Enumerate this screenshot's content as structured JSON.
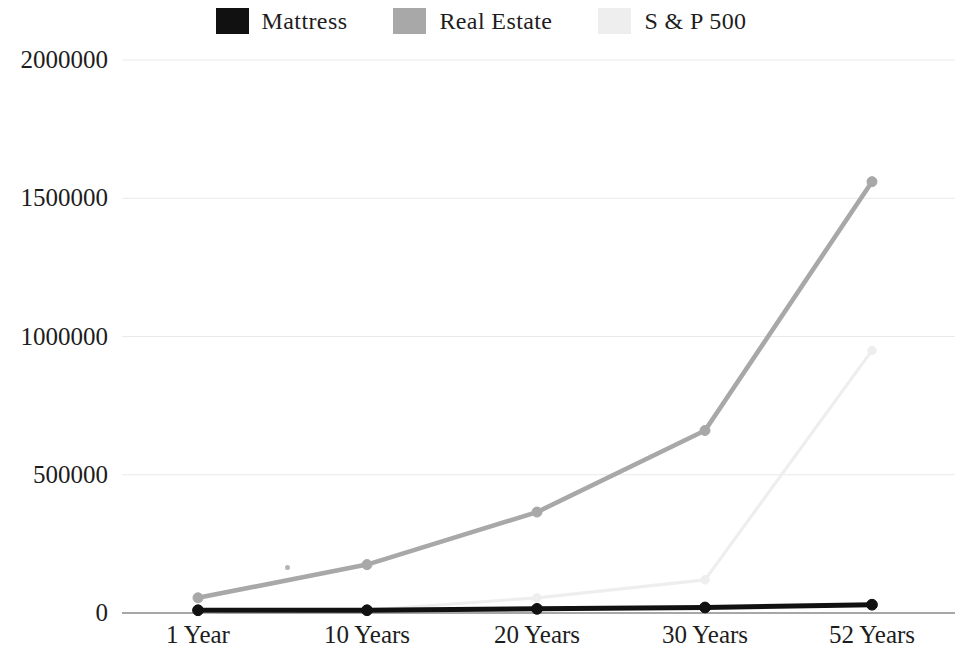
{
  "legend": {
    "position": "top-center",
    "items": [
      {
        "label": "Mattress",
        "color": "#111111",
        "swatch": "legend-swatch-mattress"
      },
      {
        "label": "Real Estate",
        "color": "#a8a8a8",
        "swatch": "legend-swatch-real-estate"
      },
      {
        "label": "S & P 500",
        "color": "#eeeeee",
        "swatch": "legend-swatch-sp500"
      }
    ]
  },
  "axes": {
    "y_ticks": [
      "0",
      "500000",
      "1000000",
      "1500000",
      "2000000"
    ],
    "x_ticks": [
      "1 Year",
      "10 Years",
      "20 Years",
      "30 Years",
      "52 Years"
    ]
  },
  "chart_data": {
    "type": "line",
    "title": "",
    "subtitle": "",
    "xlabel": "",
    "ylabel": "",
    "categories": [
      "1 Year",
      "10 Years",
      "20 Years",
      "30 Years",
      "52 Years"
    ],
    "ylim": [
      0,
      2000000
    ],
    "yticks": [
      0,
      500000,
      1000000,
      1500000,
      2000000
    ],
    "grid": true,
    "grid_axis": "y",
    "legend_position": "top-center",
    "series": [
      {
        "name": "Mattress",
        "color": "#111111",
        "values": [
          10000,
          10000,
          15000,
          20000,
          30000
        ]
      },
      {
        "name": "Real Estate",
        "color": "#a8a8a8",
        "values": [
          55000,
          175000,
          365000,
          660000,
          1560000
        ]
      },
      {
        "name": "S & P 500",
        "color": "#eeeeee",
        "values": [
          5000,
          10000,
          55000,
          120000,
          950000
        ]
      }
    ]
  }
}
